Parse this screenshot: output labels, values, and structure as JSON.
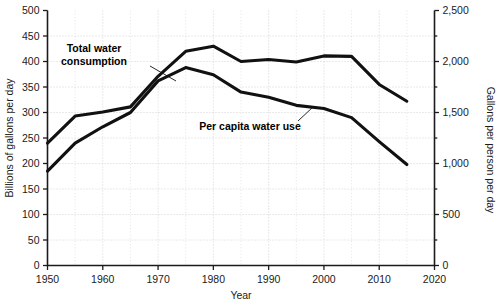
{
  "chart_data": {
    "type": "line",
    "title": "",
    "xlabel": "Year",
    "ylabel": "Billions of gallons per day",
    "y2label": "Gallons per person per day",
    "xlim": [
      1950,
      2020
    ],
    "ylim": [
      0,
      500
    ],
    "y2lim": [
      0,
      2500
    ],
    "grid": true,
    "legend_position": "inline-annotations",
    "xticks": [
      "1950",
      "1960",
      "1970",
      "1980",
      "1990",
      "2000",
      "2010",
      "2020"
    ],
    "xtick_values": [
      1950,
      1960,
      1970,
      1980,
      1990,
      2000,
      2010,
      2020
    ],
    "yticks": [
      "0",
      "50",
      "100",
      "150",
      "200",
      "250",
      "300",
      "350",
      "400",
      "450",
      "500"
    ],
    "ytick_values": [
      0,
      50,
      100,
      150,
      200,
      250,
      300,
      350,
      400,
      450,
      500
    ],
    "y2ticks": [
      "0",
      "500",
      "1,000",
      "1,500",
      "2,000",
      "2,500"
    ],
    "y2tick_values": [
      0,
      500,
      1000,
      1500,
      2000,
      2500
    ],
    "x": [
      1950,
      1955,
      1960,
      1965,
      1970,
      1975,
      1980,
      1985,
      1990,
      1995,
      2000,
      2005,
      2010,
      2015
    ],
    "series": [
      {
        "name": "Total water consumption",
        "axis": "left",
        "units": "Billions of gallons per day",
        "values": [
          240,
          293,
          301,
          311,
          371,
          420,
          430,
          400,
          404,
          399,
          411,
          410,
          355,
          322
        ]
      },
      {
        "name": "Per capita water use",
        "axis": "right",
        "units": "Gallons per person per day",
        "values": [
          925,
          1200,
          1360,
          1500,
          1810,
          1940,
          1870,
          1700,
          1650,
          1570,
          1540,
          1450,
          1215,
          990
        ]
      }
    ],
    "annotations": [
      {
        "text_line1": "Total water",
        "text_line2": "consumption",
        "target_series": "Total water consumption"
      },
      {
        "text_line1": "Per capita water use",
        "text_line2": "",
        "target_series": "Per capita water use"
      }
    ]
  }
}
